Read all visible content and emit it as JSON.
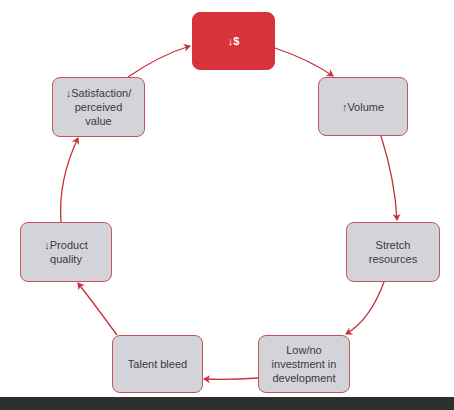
{
  "diagram": {
    "type": "cycle",
    "accent_color": "#d8323a",
    "node_fill": "#d3d3d9",
    "arrow_color": "#c8303a",
    "nodes": [
      {
        "id": "price",
        "label": "↓$"
      },
      {
        "id": "volume",
        "label": "↑Volume"
      },
      {
        "id": "stretch",
        "label": "Stretch\nresources"
      },
      {
        "id": "investment",
        "label": "Low/no\ninvestment in\ndevelopment"
      },
      {
        "id": "talent",
        "label": "Talent bleed"
      },
      {
        "id": "quality",
        "label": "↓Product\nquality"
      },
      {
        "id": "satisfaction",
        "label": "↓Satisfaction/\nperceived\nvalue"
      }
    ],
    "edges": [
      [
        "price",
        "volume"
      ],
      [
        "volume",
        "stretch"
      ],
      [
        "stretch",
        "investment"
      ],
      [
        "investment",
        "talent"
      ],
      [
        "talent",
        "quality"
      ],
      [
        "quality",
        "satisfaction"
      ],
      [
        "satisfaction",
        "price"
      ]
    ]
  }
}
